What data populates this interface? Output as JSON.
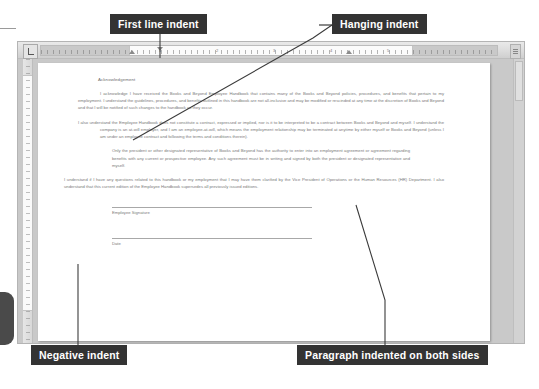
{
  "figure": {
    "type": "word-processor-indent-annotation",
    "callouts": [
      {
        "id": "first-line-indent",
        "label": "First line indent",
        "position": "top-left"
      },
      {
        "id": "hanging-indent",
        "label": "Hanging indent",
        "position": "top-right"
      },
      {
        "id": "negative-indent",
        "label": "Negative indent",
        "position": "bottom-left"
      },
      {
        "id": "both-sides-indent",
        "label": "Paragraph indented on both sides",
        "position": "bottom-right"
      }
    ],
    "colors": {
      "callout_background": "#333333",
      "callout_text": "#ffffff",
      "leader_line": "#3b3b3b",
      "page_background": "#ffffff",
      "app_chrome": "#cfcfcf",
      "edge_tab": "#4a4a4a"
    }
  },
  "ruler": {
    "tab_selector_glyph": "L",
    "numbers": [
      "1",
      "2",
      "3",
      "4",
      "5"
    ]
  },
  "document": {
    "heading": "Acknowledgement",
    "paragraphs": [
      "I acknowledge I have received the Books and Beyond Employee Handbook that contains many of the Books and Beyond policies, procedures, and benefits that pertain to my employment. I understand the guidelines, procedures, and benefits outlined in this handbook are not all-inclusive and may be modified or rescinded at any time at the discretion of Books and Beyond and that I will be notified of such changes to the handbook as they occur.",
      "I also understand the Employee Handbook does not constitute a contract, expressed or implied, nor is it to be interpreted to be a contract between Books and Beyond and myself. I understand the company is an at-will employer, and I am an employee-at-will, which means the employment relationship may be terminated at anytime by either myself or Books and Beyond (unless I am under an employee contract and following the terms and conditions therein).",
      "Only the president or other designated representative of Books and Beyond has the authority to enter into an employment agreement or agreement regarding benefits with any current or prospective employee. Any such agreement must be in writing and signed by both the president or designated representative and myself.",
      "I understand if I have any questions related to this handbook or my employment that I may have them clarified by the Vice President of Operations or the Human Resources (HR) Department. I also understand that this current edition of the Employee Handbook supersedes all previously issued editions."
    ],
    "signature_label": "Employee Signature",
    "date_label": "Date"
  }
}
